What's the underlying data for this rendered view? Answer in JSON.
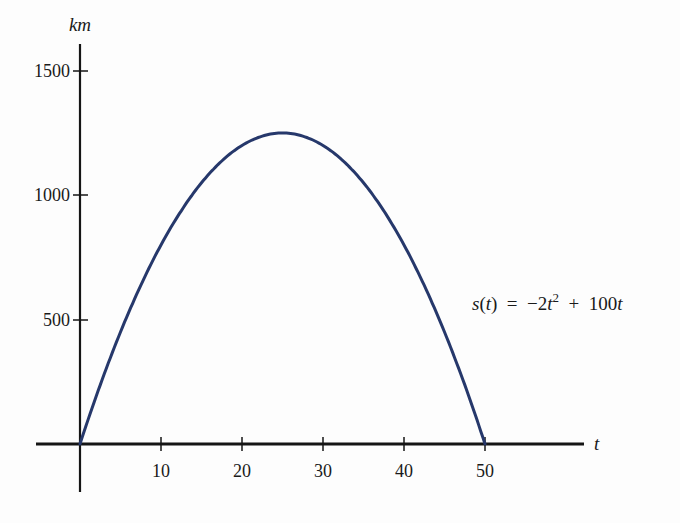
{
  "chart_data": {
    "type": "line",
    "title": "",
    "equation": "s(t) = −2t² + 100t",
    "xlabel": "t",
    "ylabel": "km",
    "xlim": [
      0,
      50
    ],
    "ylim": [
      0,
      1500
    ],
    "x_ticks": [
      10,
      20,
      30,
      40,
      50
    ],
    "y_ticks": [
      500,
      1000,
      1500
    ],
    "grid": false,
    "legend": null,
    "series": [
      {
        "name": "s(t) = −2t² + 100t",
        "color": "#26386b",
        "x": [
          0,
          5,
          10,
          15,
          20,
          25,
          30,
          35,
          40,
          45,
          50
        ],
        "values": [
          0,
          450,
          800,
          1050,
          1200,
          1250,
          1200,
          1050,
          800,
          450,
          0
        ]
      }
    ]
  },
  "labels": {
    "y_axis": "km",
    "x_axis": "t",
    "x_ticks": [
      "10",
      "20",
      "30",
      "40",
      "50"
    ],
    "y_ticks": [
      "500",
      "1000",
      "1500"
    ],
    "eq_s": "s",
    "eq_paren": "(t)",
    "eq_equals": "=",
    "eq_minus2t": "−2t",
    "eq_sq": "2",
    "eq_plus": "+",
    "eq_100t": "100t"
  }
}
